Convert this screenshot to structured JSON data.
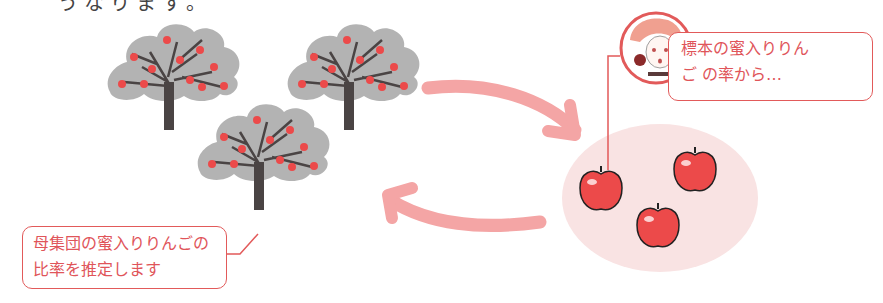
{
  "top_fragment": "うなります。",
  "bottom_fragment": "",
  "diagram": {
    "population": {
      "label": "population",
      "trees": 3,
      "callout": {
        "line1": "母集団の蜜入りりんごの",
        "line2": "比率を推定します"
      }
    },
    "sample": {
      "label": "sample",
      "apples": 3,
      "callout": {
        "line1": "標本の蜜入りりん",
        "line2": "ご の率から…"
      }
    },
    "arrows": {
      "forward": "population-to-sample",
      "backward": "sample-to-population"
    },
    "colors": {
      "accent": "#e25a5a",
      "arrow": "#f4a5a5",
      "sample_bg": "#f9e3e3",
      "foliage": "#b3b3b3",
      "trunk": "#4a4444",
      "apple": "#ec4a4a"
    }
  }
}
